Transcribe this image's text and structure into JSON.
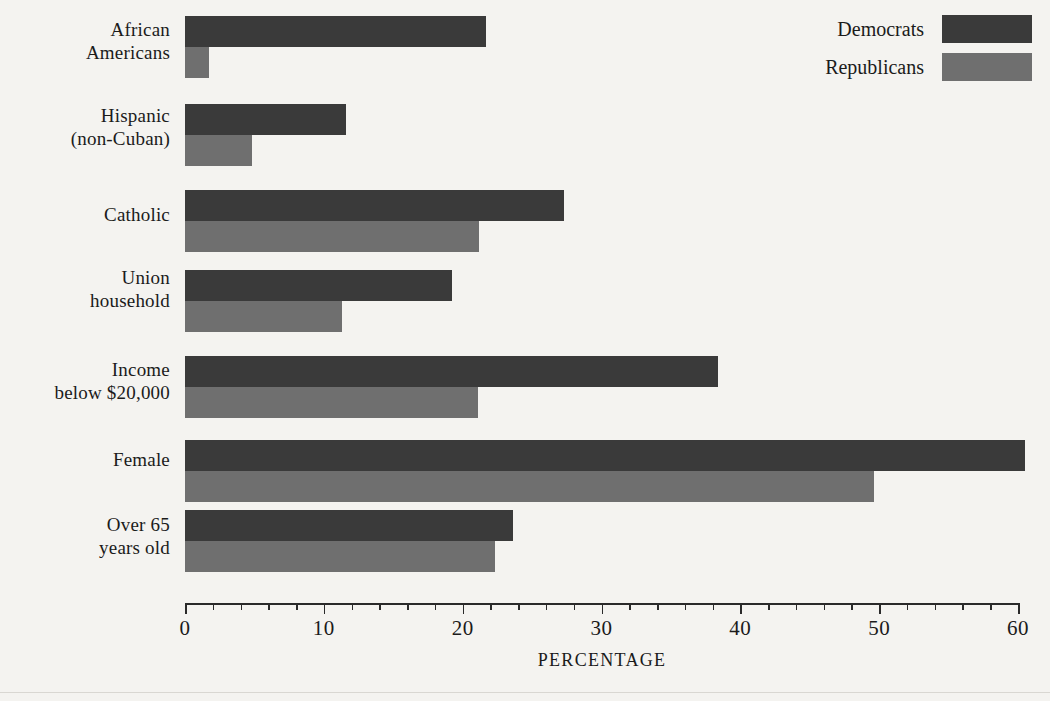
{
  "chart_data": {
    "type": "bar",
    "orientation": "horizontal",
    "title": "",
    "xlabel": "PERCENTAGE",
    "ylabel": "",
    "xlim": [
      0,
      60
    ],
    "xticks": [
      0,
      10,
      20,
      30,
      40,
      50,
      60
    ],
    "xtick_labels": [
      "0",
      "10",
      "20",
      "30",
      "40",
      "50",
      "60"
    ],
    "minor_tick_interval": 2,
    "grid": false,
    "legend_position": "top-right",
    "categories": [
      "African Americans",
      "Hispanic (non-Cuban)",
      "Catholic",
      "Union household",
      "Income below $20,000",
      "Female",
      "Over 65 years old"
    ],
    "category_lines": [
      [
        "African",
        "Americans"
      ],
      [
        "Hispanic",
        "(non-Cuban)"
      ],
      [
        "Catholic"
      ],
      [
        "Union",
        "household"
      ],
      [
        "Income",
        "below $20,000"
      ],
      [
        "Female"
      ],
      [
        "Over 65",
        "years old"
      ]
    ],
    "series": [
      {
        "name": "Democrats",
        "color": "#3a3a3a",
        "values": [
          21.7,
          11.6,
          27.3,
          19.2,
          38.4,
          60.5,
          23.6
        ]
      },
      {
        "name": "Republicans",
        "color": "#6f6f6f",
        "values": [
          1.7,
          4.8,
          21.2,
          11.3,
          21.1,
          49.6,
          22.3
        ]
      }
    ]
  },
  "legend": {
    "entries": [
      {
        "label": "Democrats",
        "color": "#3a3a3a"
      },
      {
        "label": "Republicans",
        "color": "#6f6f6f"
      }
    ]
  },
  "axis": {
    "x_title": "PERCENTAGE"
  },
  "colors": {
    "background": "#f4f3f0",
    "democrat": "#3a3a3a",
    "republican": "#6f6f6f",
    "axis": "#2a2a2a",
    "text": "#1b1b1b"
  }
}
